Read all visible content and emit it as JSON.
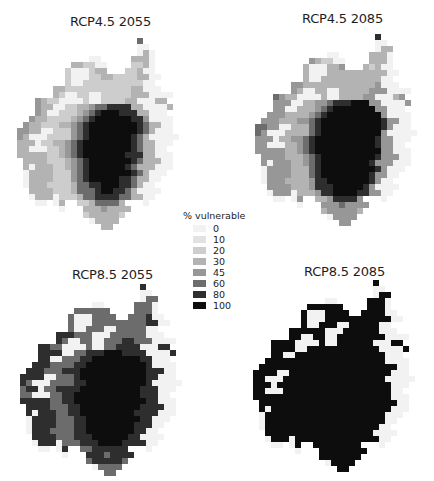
{
  "figure": {
    "legend": {
      "title": "% vulnerable",
      "items": [
        {
          "label": "0",
          "color": "#f2f2f2"
        },
        {
          "label": "10",
          "color": "#e2e2e2"
        },
        {
          "label": "20",
          "color": "#cdcdcd"
        },
        {
          "label": "30",
          "color": "#b3b3b3"
        },
        {
          "label": "45",
          "color": "#979797"
        },
        {
          "label": "60",
          "color": "#6c6c6c"
        },
        {
          "label": "80",
          "color": "#2e2e2e"
        },
        {
          "label": "100",
          "color": "#0d0d0d"
        }
      ]
    },
    "panels": [
      {
        "title": "RCP4.5 2055"
      },
      {
        "title": "RCP4.5 2085"
      },
      {
        "title": "RCP8.5 2055"
      },
      {
        "title": "RCP8.5 2085"
      }
    ]
  },
  "map_data": {
    "cell_size_px": 6,
    "encoding": "'.' = outside region; digits 0-7 index legend classes 0,10,20,30,45,60,80,100 %",
    "grids": [
      [
        "......................5.......",
        "......................00......",
        "......................030.....",
        "..............00.....3330.....",
        "...........332200....2230.....",
        "..........2000233...22300.....",
        "..........2000223322223300....",
        "..........200222222222200.....",
        "........332222222222233000....",
        "........32002200222223330000..",
        ".....4322000020022223300033...",
        ".....43300223345566663300003..",
        ".....4300222345677766633000...",
        "....433222234567777776640000..",
        "...4332223345677777777653300..",
        "..44330022245677777777653000..",
        "..430002222456777777765300000.",
        "..33302233456777777776533000..",
        "..3300022345677777777653300...",
        "..33333223456777777766633000..",
        "...3333222345677777776533300..",
        "...3033322345677777765333000..",
        "...033332224567777777653000...",
        "...03333222456777776653300....",
        "...0333222235566777665300.....",
        "....3333222355567766530000....",
        "....033302223556666553300.....",
        ".....00.03..22355553...0......",
        ".........0...33343333.........",
        ".............2333332..........",
        "..............03333...........",
        "................33............"
      ],
      [
        "......................6.......",
        "......................00......",
        "......................033.....",
        "..............00.....3330.....",
        "...........432200....3330.....",
        "..........3000334...32300.....",
        "..........3000333333333300....",
        "..........300333333333300.....",
        "........443333333333334000....",
        "........43003300333334440000..",
        ".....5433000030033334400034...",
        ".....44400334456667774400004..",
        ".....4400333456777777744000...",
        "....444333345677777777740000..",
        "...4443334456777777777764400..",
        "..55440033356777777777764000..",
        "..540003333567777777777400000.",
        "..44403344567777777777644000..",
        "..4400033456777777777764400...",
        "..44444334567777777777744000..",
        "...4444333456777777777644400..",
        "...4044433456777777776444000..",
        "...044443335677777777764000...",
        "...04444333567777777764400....",
        "...0444333346677777776400.....",
        "....4444333466677777640000....",
        "....044403334667777664400.....",
        ".....00.04..33466664...0......",
        ".........0...44454444.........",
        ".............3444443..........",
        "..............04444...........",
        "................44............"
      ],
      [
        "......................6.......",
        "......................00......",
        "......................055.....",
        "..............00.....5550.....",
        "...........555555....5550.....",
        "..........50005555..555600....",
        "..........50005555555556600...",
        "..........500555005555500.....",
        "........666555000555555000....",
        "........65005500555665550000..",
        ".....6655000050055666600066...",
        ".....66660055666777666600006..",
        ".....6600555667777777766000...",
        "....666555566777777777760000..",
        "...6665556667777777777766600..",
        "..66660055567777777777766000..",
        "..650005555667777777777600000.",
        "..56605566667777777777666000..",
        "..5500055667777777777766600...",
        "..66666556677777777777766000..",
        "...6666555667777777777666600..",
        "...6066655667777777776666000..",
        "...066665556677777777766000...",
        "...06666555667777777766600....",
        "...0666555566777777776600.....",
        "....6666555666777777660000....",
        "....066605556667777666600.....",
        ".....00.06..55666666...0......",
        ".........0...66656666.........",
        ".............5666665..........",
        "..............05555...........",
        "................55............"
      ],
      [
        "......................7.......",
        "......................00......",
        "......................077.....",
        "..............00.....7770.....",
        "...........777777....7770.....",
        "..........70007777..777700....",
        "..........70007777777777700...",
        "..........700777007777700.....",
        "........777777000777777000....",
        "........77007700777777770000..",
        ".....7777000070077777700077...",
        ".....77770077777777777700007..",
        ".....7700777777777777777000...",
        "....777777777777777777770000..",
        "...7777777777777777777777700..",
        "..77770077777777777777777000..",
        "..770007777777777777777700000.",
        "..77707777777777777777777000..",
        "..7700077777777777777777700...",
        "..77777777777777777777777000..",
        "...7777777777777777777777700..",
        "...7077777777777777777777000..",
        "...077777777777777777777000...",
        "...07777777777777777777700....",
        "...0777777777777777777700.....",
        "....7777777777777777770000....",
        "....077707777777777777700.....",
        ".....00.07..77777777...0......",
        ".........0...77777777.........",
        ".............7777777..........",
        "..............07777...........",
        "................77............"
      ]
    ]
  }
}
